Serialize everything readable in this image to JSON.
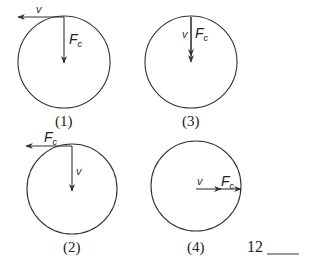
{
  "diagram": {
    "line_color": "#333333",
    "panels": [
      {
        "id": "1",
        "caption": "(1)",
        "circle": {
          "cx": 64,
          "cy": 62,
          "r": 46
        },
        "arrows": [
          {
            "name": "v",
            "label": "v",
            "direction": "left",
            "x1": 64,
            "y1": 17,
            "x2": 18,
            "y2": 17
          },
          {
            "name": "Fc",
            "label": "F",
            "sub": "c",
            "direction": "down",
            "x1": 64,
            "y1": 17,
            "x2": 64,
            "y2": 63
          }
        ]
      },
      {
        "id": "3",
        "caption": "(3)",
        "circle": {
          "cx": 191,
          "cy": 62,
          "r": 46
        },
        "arrows": [
          {
            "name": "v",
            "label": "v",
            "direction": "down",
            "x1": 191,
            "y1": 17,
            "x2": 191,
            "y2": 56
          },
          {
            "name": "Fc",
            "label": "F",
            "sub": "c",
            "direction": "down",
            "x1": 191,
            "y1": 17,
            "x2": 191,
            "y2": 62
          }
        ]
      },
      {
        "id": "2",
        "caption": "(2)",
        "circle": {
          "cx": 72,
          "cy": 189,
          "r": 45
        },
        "arrows": [
          {
            "name": "Fc",
            "label": "F",
            "sub": "c",
            "direction": "left",
            "x1": 72,
            "y1": 146,
            "x2": 26,
            "y2": 146
          },
          {
            "name": "v",
            "label": "v",
            "direction": "down",
            "x1": 72,
            "y1": 146,
            "x2": 72,
            "y2": 191
          }
        ]
      },
      {
        "id": "4",
        "caption": "(4)",
        "circle": {
          "cx": 196,
          "cy": 186,
          "r": 45
        },
        "arrows": [
          {
            "name": "v",
            "label": "v",
            "direction": "right",
            "x1": 196,
            "y1": 189,
            "x2": 221,
            "y2": 189
          },
          {
            "name": "Fc",
            "label": "F",
            "sub": "c",
            "direction": "right",
            "x1": 218,
            "y1": 189,
            "x2": 241,
            "y2": 189
          }
        ]
      }
    ],
    "question": {
      "number": "12",
      "answer_blank": ""
    }
  }
}
